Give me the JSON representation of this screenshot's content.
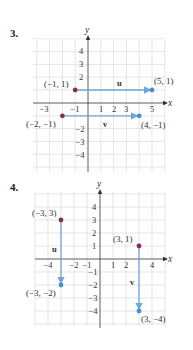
{
  "problems": [
    {
      "number": "3.",
      "axes": {
        "x_label": "x",
        "y_label": "y",
        "x_ticks": [
          "−3",
          "−1",
          "1",
          "2",
          "3",
          "5"
        ],
        "y_ticks": [
          "4",
          "3",
          "2",
          "−2",
          "−3",
          "−4"
        ]
      },
      "vectors": [
        {
          "name": "u",
          "start": [
            -1,
            1
          ],
          "end": [
            5,
            1
          ],
          "start_label": "(−1, 1)",
          "end_label": "(5, 1)"
        },
        {
          "name": "v",
          "start": [
            -2,
            -1
          ],
          "end": [
            4,
            -1
          ],
          "start_label": "(−2, −1)",
          "end_label": "(4, −1)"
        }
      ]
    },
    {
      "number": "4.",
      "axes": {
        "x_label": "x",
        "y_label": "y",
        "x_ticks": [
          "−4",
          "−2",
          "−1",
          "1",
          "2",
          "4"
        ],
        "y_ticks": [
          "4",
          "3",
          "2",
          "1",
          "−1",
          "−2",
          "−3",
          "−4"
        ]
      },
      "vectors": [
        {
          "name": "u",
          "start": [
            -3,
            3
          ],
          "end": [
            -3,
            -2
          ],
          "start_label": "(−3, 3)",
          "end_label": "(−3, −2)"
        },
        {
          "name": "v",
          "start": [
            3,
            1
          ],
          "end": [
            3,
            -4
          ],
          "start_label": "(3, 1)",
          "end_label": "(3, −4)"
        }
      ]
    }
  ],
  "colors": {
    "start_point": "#8b2d4a",
    "end_point": "#4a90d0",
    "vector": "#6fa6d8",
    "grid": "#d4d4d4",
    "axis": "#333333"
  }
}
